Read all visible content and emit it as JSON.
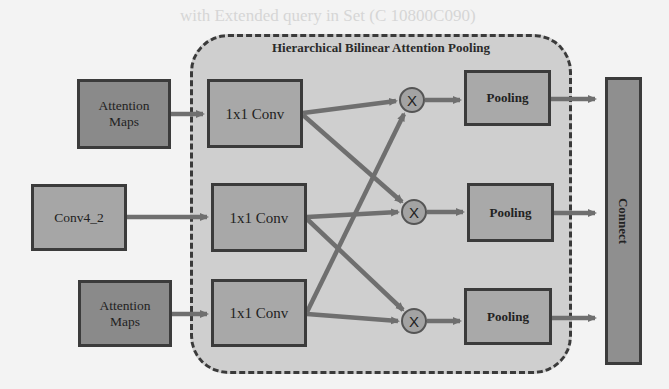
{
  "background_text": {
    "line1": "with Extended query in Set (C 10800C090)",
    "line2": "Stage and Attention Guided ...",
    "color": "#d6d6d6"
  },
  "diagram": {
    "region": {
      "title": "Hierarchical Bilinear Attention Pooling",
      "fill": "#cfcfcf",
      "border_style": "dashed"
    },
    "inputs": [
      {
        "id": "attn_top",
        "label": "Attention Maps"
      },
      {
        "id": "conv4_2",
        "label": "Conv4_2"
      },
      {
        "id": "attn_bottom",
        "label": "Attention Maps"
      }
    ],
    "convs": [
      {
        "id": "conv_a",
        "label": "1x1 Conv"
      },
      {
        "id": "conv_b",
        "label": "1x1 Conv"
      },
      {
        "id": "conv_c",
        "label": "1x1 Conv"
      }
    ],
    "multipliers": [
      {
        "id": "x1",
        "label": "X"
      },
      {
        "id": "x2",
        "label": "X"
      },
      {
        "id": "x3",
        "label": "X"
      }
    ],
    "poolings": [
      {
        "id": "pool1",
        "label": "Pooling"
      },
      {
        "id": "pool2",
        "label": "Pooling"
      },
      {
        "id": "pool3",
        "label": "Pooling"
      }
    ],
    "output": {
      "label": "Connect"
    },
    "edges": [
      [
        "attn_top",
        "conv_a"
      ],
      [
        "conv4_2",
        "conv_b"
      ],
      [
        "attn_bottom",
        "conv_c"
      ],
      [
        "conv_a",
        "x1"
      ],
      [
        "conv_a",
        "x2"
      ],
      [
        "conv_b",
        "x2"
      ],
      [
        "conv_b",
        "x3"
      ],
      [
        "conv_c",
        "x3"
      ],
      [
        "conv_c",
        "x1"
      ],
      [
        "x1",
        "pool1"
      ],
      [
        "x2",
        "pool2"
      ],
      [
        "x3",
        "pool3"
      ],
      [
        "pool1",
        "connect"
      ],
      [
        "pool2",
        "connect"
      ],
      [
        "pool3",
        "connect"
      ]
    ]
  }
}
